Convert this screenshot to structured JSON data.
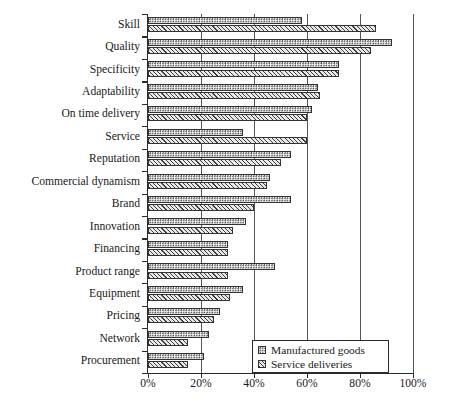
{
  "chart_data": {
    "type": "bar",
    "orientation": "horizontal",
    "title": "",
    "xlabel": "",
    "ylabel": "",
    "xlim": [
      0,
      100
    ],
    "xticks": [
      "0%",
      "20%",
      "40%",
      "60%",
      "80%",
      "100%"
    ],
    "xtick_values": [
      0,
      20,
      40,
      60,
      80,
      100
    ],
    "grid": true,
    "legend_position": "bottom-right",
    "categories": [
      "Skill",
      "Quality",
      "Specificity",
      "Adaptability",
      "On time delivery",
      "Service",
      "Reputation",
      "Commercial dynamism",
      "Brand",
      "Innovation",
      "Financing",
      "Product range",
      "Equipment",
      "Pricing",
      "Network",
      "Procurement"
    ],
    "series": [
      {
        "name": "Manufactured goods",
        "pattern": "dotted",
        "values": [
          58,
          92,
          72,
          64,
          62,
          36,
          54,
          46,
          54,
          37,
          30,
          48,
          36,
          27,
          23,
          21
        ]
      },
      {
        "name": "Service deliveries",
        "pattern": "hatched",
        "values": [
          86,
          84,
          72,
          65,
          60,
          60,
          50,
          45,
          40,
          32,
          30,
          30,
          31,
          25,
          15,
          15
        ]
      }
    ]
  },
  "legend": {
    "items": [
      {
        "label": "Manufactured goods"
      },
      {
        "label": "Service deliveries"
      }
    ]
  },
  "colors": {
    "axis": "#2b2b2b",
    "grid": "#555555",
    "bar_outline": "#333333",
    "background": "#ffffff"
  }
}
